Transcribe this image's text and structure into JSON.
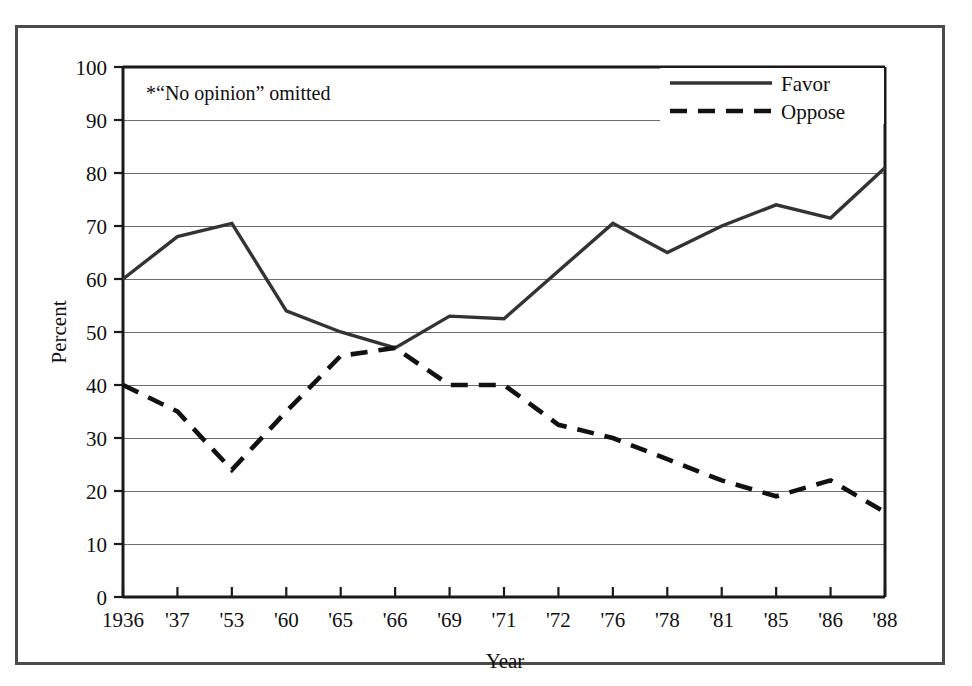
{
  "chart_data": {
    "type": "line",
    "title": "",
    "xlabel": "Year",
    "ylabel": "Percent",
    "categories": [
      "1936",
      "'37",
      "'53",
      "'60",
      "'65",
      "'66",
      "'69",
      "'71",
      "'72",
      "'76",
      "'78",
      "'81",
      "'85",
      "'86",
      "'88"
    ],
    "series": [
      {
        "name": "Favor",
        "style": "solid",
        "values": [
          60,
          68,
          70.5,
          54,
          50,
          47,
          53,
          52.5,
          61.5,
          70.5,
          65,
          70,
          74,
          71.5,
          81
        ]
      },
      {
        "name": "Oppose",
        "style": "dashed",
        "values": [
          40,
          35,
          24,
          35,
          45.5,
          47,
          40,
          40,
          32.5,
          30,
          26,
          22,
          19,
          22,
          16
        ]
      }
    ],
    "ylim": [
      0,
      100
    ],
    "ytick_step": 10,
    "yticks": [
      "0",
      "10",
      "20",
      "30",
      "40",
      "50",
      "60",
      "70",
      "80",
      "90",
      "100"
    ],
    "grid": true,
    "legend_position": "top-right",
    "annotation": "*“No opinion” omitted",
    "colors": {
      "favor": "#333333",
      "oppose": "#111111",
      "grid": "#6e6e6e",
      "axis": "#1a1a1a",
      "frame": "#4a4a4a",
      "background": "#ffffff"
    }
  },
  "legend": {
    "items": [
      {
        "label": "Favor"
      },
      {
        "label": "Oppose"
      }
    ]
  },
  "axes": {
    "y_title": "Percent",
    "x_title": "Year"
  },
  "note": {
    "text": "*“No opinion” omitted"
  }
}
